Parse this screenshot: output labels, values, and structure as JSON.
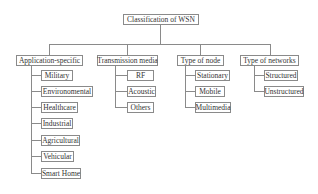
{
  "diagram": {
    "root": "Classification of WSN",
    "categories": [
      {
        "label": "Application-specific",
        "children": [
          "Military",
          "Environomental",
          "Healthcare",
          "Industrial",
          "Agricultural",
          "Vehicular",
          "Smart Home"
        ]
      },
      {
        "label": "Transmission media",
        "children": [
          "RF",
          "Acoustic",
          "Others"
        ]
      },
      {
        "label": "Type of node",
        "children": [
          "Stationary",
          "Mobile",
          "Multimedia"
        ]
      },
      {
        "label": "Type of networks",
        "children": [
          "Structured",
          "Unstructured"
        ]
      }
    ]
  }
}
